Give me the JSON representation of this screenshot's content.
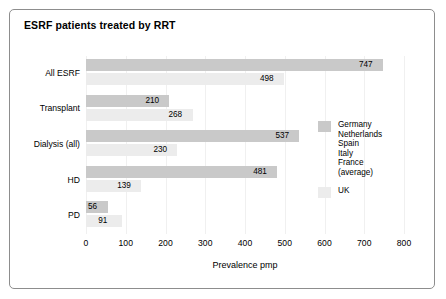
{
  "chart_data": {
    "type": "bar",
    "orientation": "horizontal",
    "title": "ESRF patients treated by RRT",
    "xlabel": "Prevalence pmp",
    "ylabel": "",
    "xlim": [
      0,
      800
    ],
    "xticks": [
      0,
      100,
      200,
      300,
      400,
      500,
      600,
      700,
      800
    ],
    "xtick_labels": [
      "0",
      "100",
      "200",
      "300",
      "400",
      "500",
      "600",
      "700",
      "800"
    ],
    "grid": "vertical-faint",
    "legend_position": "right-middle",
    "categories": [
      "All ESRF",
      "Transplant",
      "Dialysis (all)",
      "HD",
      "PD"
    ],
    "series": [
      {
        "name": "Germany Netherlands Spain Italy France (average)",
        "color": "#c9c9c9",
        "values": [
          747,
          210,
          537,
          481,
          56
        ],
        "value_labels": [
          "747",
          "210",
          "537",
          "481",
          "56"
        ]
      },
      {
        "name": "UK",
        "color": "#ececec",
        "values": [
          498,
          268,
          230,
          139,
          91
        ],
        "value_labels": [
          "498",
          "268",
          "230",
          "139",
          "91"
        ]
      }
    ]
  },
  "legend": {
    "entries": [
      {
        "swatch": "dark",
        "lines": [
          "Germany",
          "Netherlands",
          "Spain",
          "Italy",
          "France",
          "(average)"
        ]
      },
      {
        "swatch": "light",
        "lines": [
          "UK"
        ]
      }
    ]
  },
  "colors": {
    "series_dark": "#c9c9c9",
    "series_light": "#ececec",
    "frame_border": "#8d8d8d",
    "gridline": "#f0f0f0",
    "text": "#000000",
    "background": "#ffffff"
  }
}
